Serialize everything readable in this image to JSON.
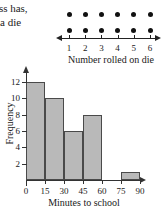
{
  "caption": {
    "line1": "ass has,",
    "line2": "a die"
  },
  "colors": {
    "bar_fill": "#b9b9b9",
    "bar_stroke": "#4a4a4a",
    "axis": "#333333",
    "dot": "#111111",
    "background": "#ffffff"
  },
  "chart_data": [
    {
      "type": "scatter",
      "plot_kind": "dot-plot",
      "title": "",
      "xlabel": "Number rolled on die",
      "ylabel": "",
      "categories": [
        "1",
        "2",
        "3",
        "4",
        "5",
        "6"
      ],
      "values": [
        2,
        2,
        2,
        2,
        2,
        2
      ],
      "tick_labels": [
        "1",
        "2",
        "3",
        "4",
        "5",
        "6"
      ],
      "dot_value": 1,
      "total_dots": 12,
      "axis_arrows": [
        "left",
        "right"
      ],
      "grid": false,
      "legend": null
    },
    {
      "type": "bar",
      "plot_kind": "histogram",
      "title": "",
      "xlabel": "Minutes to school",
      "ylabel": "Frequency",
      "bin_edges": [
        0,
        15,
        30,
        45,
        60,
        75,
        90
      ],
      "categories": [
        "0-15",
        "15-30",
        "30-45",
        "45-60",
        "60-75",
        "75-90"
      ],
      "values": [
        12,
        10,
        6,
        8,
        0,
        1
      ],
      "xticks": [
        "0",
        "15",
        "30",
        "45",
        "60",
        "75",
        "90"
      ],
      "yticks": [
        "2",
        "4",
        "6",
        "8",
        "10",
        "12"
      ],
      "xlim": [
        0,
        90
      ],
      "ylim": [
        0,
        13
      ],
      "grid": false,
      "legend": null,
      "axis_arrows": [
        "up",
        "right"
      ]
    }
  ]
}
